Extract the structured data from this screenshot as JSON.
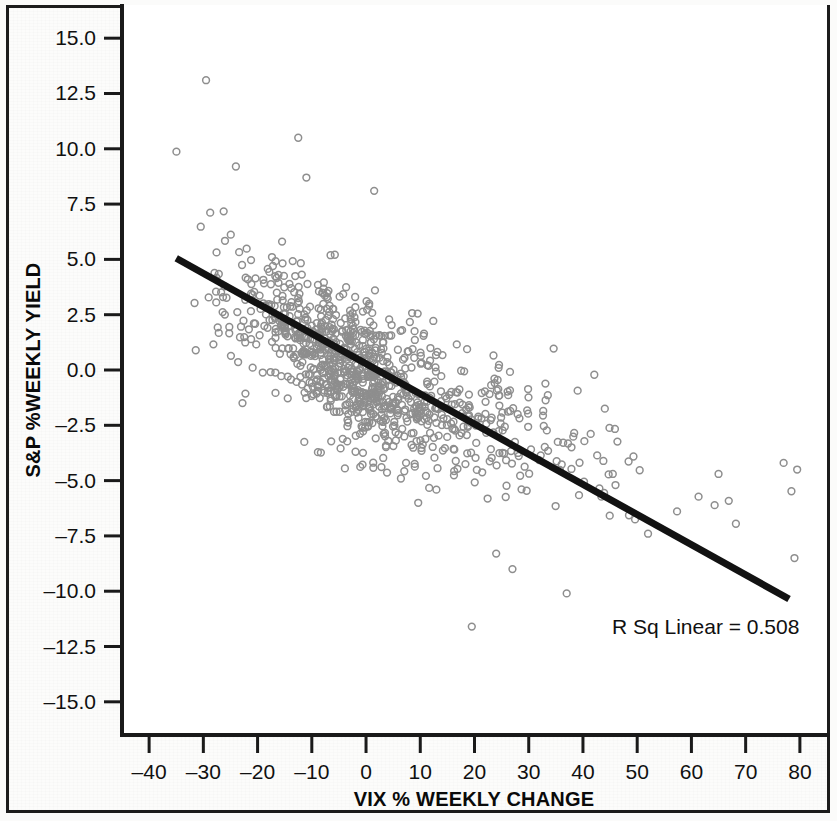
{
  "figure": {
    "background_color": "#fcfcfb",
    "frame_color": "#1c1c1c",
    "width": 837,
    "height": 821
  },
  "chart_data": {
    "type": "scatter",
    "title": "",
    "subtitle": "",
    "xlabel": "VIX % WEEKLY CHANGE",
    "ylabel": "S&P %WEEKLY YIELD",
    "xlim": [
      -45,
      85
    ],
    "ylim": [
      -16.5,
      16.5
    ],
    "xticks": [
      -40,
      -30,
      -20,
      -10,
      0,
      10,
      20,
      30,
      40,
      50,
      60,
      70,
      80
    ],
    "xtick_labels": [
      "–40",
      "–30",
      "–20",
      "–10",
      "0",
      "10",
      "20",
      "30",
      "40",
      "50",
      "60",
      "70",
      "80"
    ],
    "yticks": [
      15.0,
      12.5,
      10.0,
      7.5,
      5.0,
      2.5,
      0.0,
      -2.5,
      -5.0,
      -7.5,
      -10.0,
      -12.5,
      -15.0
    ],
    "ytick_labels": [
      "15.0",
      "12.5",
      "10.0",
      "7.5",
      "5.0",
      "2.5",
      "0.0",
      "–2.5",
      "–5.0",
      "–7.5",
      "–10.0",
      "–12.5",
      "–15.0"
    ],
    "grid": false,
    "legend": null,
    "marker": {
      "shape": "open-circle",
      "color": "#8e8e8e",
      "fill": "none",
      "radius": 3.4,
      "stroke_width": 1.5
    },
    "annotations": [
      {
        "name": "r-squared-annotation",
        "text": "R Sq Linear = 0.508",
        "x": 31,
        "y": -12.0
      }
    ],
    "fit_line": {
      "name": "linear-regression-line",
      "type": "linear",
      "color": "#121212",
      "width": 7,
      "r_squared": 0.508,
      "slope": -0.1354,
      "intercept": -0.23,
      "x_start": -35.0,
      "y_start": 5.05,
      "x_end": 78.0,
      "y_end": -10.35
    },
    "n_points": 1040,
    "correlation": -0.713,
    "series": [
      {
        "name": "Weekly observations",
        "x_mean": 0.5,
        "x_sd": 12.0,
        "y_mean": -0.3,
        "y_sd": 2.35,
        "points_note": "Dense elliptical cloud with strong negative correlation; long right tail of VIX spikes with large negative S&P yields.",
        "outliers": [
          {
            "x": -29.5,
            "y": 13.1
          },
          {
            "x": -12.5,
            "y": 10.5
          },
          {
            "x": -24.0,
            "y": 9.2
          },
          {
            "x": -11.0,
            "y": 8.7
          },
          {
            "x": 1.5,
            "y": 8.1
          },
          {
            "x": 19.5,
            "y": -11.6
          },
          {
            "x": 24.0,
            "y": -8.3
          },
          {
            "x": 27.0,
            "y": -9.0
          },
          {
            "x": 45.5,
            "y": -4.7
          },
          {
            "x": 46.0,
            "y": -5.2
          },
          {
            "x": 65.0,
            "y": -4.7
          },
          {
            "x": 77.0,
            "y": -4.2
          },
          {
            "x": 79.5,
            "y": -4.5
          },
          {
            "x": 79.0,
            "y": -8.5
          },
          {
            "x": 52.0,
            "y": -7.4
          },
          {
            "x": 37.0,
            "y": -10.1
          }
        ]
      }
    ]
  },
  "axes": {
    "plot_left_px": 122,
    "plot_top_px": 5,
    "plot_right_px": 827,
    "plot_bottom_px": 735
  }
}
